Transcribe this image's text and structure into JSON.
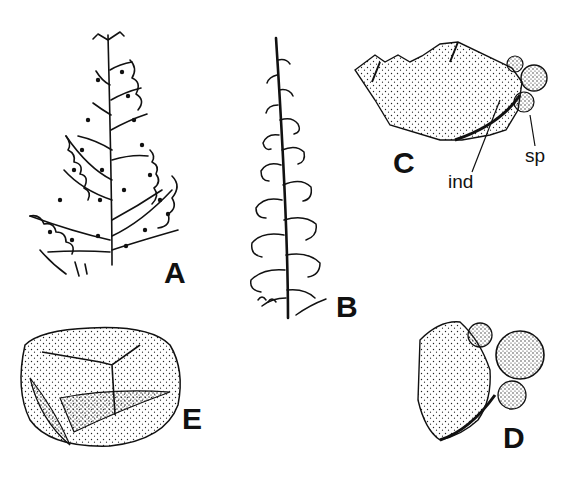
{
  "figure": {
    "panels": [
      {
        "id": "A",
        "label": "A",
        "subject": "fern frond, broad triangular, finely dissected with marginal sori"
      },
      {
        "id": "B",
        "label": "B",
        "subject": "fern frond, narrow lanceolate, finely dissected"
      },
      {
        "id": "C",
        "label": "C",
        "subject": "pinnule lobe margin with indusium and sporangia",
        "annotations": [
          "ind",
          "sp"
        ]
      },
      {
        "id": "D",
        "label": "D",
        "subject": "segment tip with sporangia cluster"
      },
      {
        "id": "E",
        "label": "E",
        "subject": "spore with trilete mark"
      }
    ],
    "annotations": {
      "indusium": "ind",
      "sporangium": "sp"
    },
    "colors": {
      "ink": "#111111",
      "background": "#ffffff"
    }
  }
}
